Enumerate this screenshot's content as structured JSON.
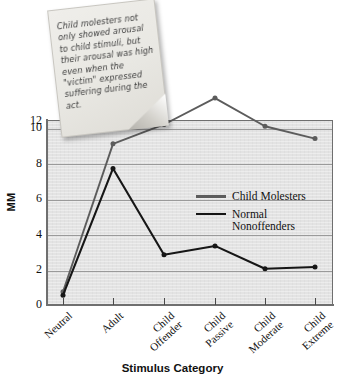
{
  "annotation": {
    "note_text": "Child molesters not only showed arousal to child stimuli, but their arousal was high even when the \"victim\" expressed suffering during the act."
  },
  "legend": {
    "position": "inside-right",
    "entries": [
      {
        "label": "Child Molesters",
        "color": "#5c5c5c"
      },
      {
        "label": "Normal\nNonoffenders",
        "color": "#161616"
      }
    ]
  },
  "axes": {
    "y_title": "MM",
    "x_title": "Stimulus Category",
    "y_ticks": [
      "0",
      "2",
      "4",
      "6",
      "8",
      "10",
      "12"
    ]
  },
  "chart_data": {
    "type": "line",
    "title": "",
    "xlabel": "Stimulus Category",
    "ylabel": "MM",
    "categories": [
      "Neutral",
      "Adult",
      "Child Offender",
      "Child Passive",
      "Child Moderate",
      "Child Extreme"
    ],
    "ylim": [
      0,
      12
    ],
    "yticks": [
      0,
      2,
      4,
      6,
      8,
      10,
      12
    ],
    "grid": true,
    "series": [
      {
        "name": "Child Molesters",
        "color": "#5c5c5c",
        "values": [
          0.7,
          9.1,
          10.2,
          11.7,
          10.1,
          9.4
        ]
      },
      {
        "name": "Normal Nonoffenders",
        "color": "#161616",
        "values": [
          0.5,
          7.7,
          2.8,
          3.3,
          2.0,
          2.1
        ]
      }
    ]
  }
}
